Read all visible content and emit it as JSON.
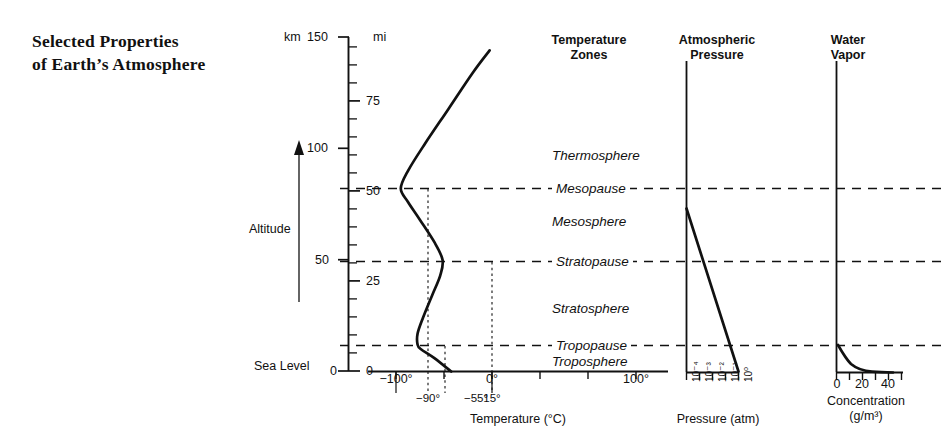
{
  "title_line1": "Selected Properties",
  "title_line2": "of Earth’s Atmosphere",
  "axis": {
    "altitude_label": "Altitude",
    "sea_level_label": "Sea Level",
    "km_unit": "km",
    "mi_unit": "mi",
    "km_ticks": [
      "150",
      "100",
      "50",
      "0"
    ],
    "mi_ticks": [
      "75",
      "50",
      "25",
      "0"
    ]
  },
  "panels": {
    "temperature": {
      "header_line1": "Temperature",
      "header_line2": "Zones",
      "caption": "Temperature (°C)",
      "ticks": [
        "−100°",
        "0°",
        "100°"
      ],
      "ref_labels": [
        "−90°",
        "−55°",
        "15°"
      ],
      "zones": [
        "Thermosphere",
        "Mesopause",
        "Mesosphere",
        "Stratopause",
        "Stratosphere",
        "Tropopause",
        "Troposphere"
      ]
    },
    "pressure": {
      "header_line1": "Atmospheric",
      "header_line2": "Pressure",
      "caption": "Pressure (atm)",
      "ticks": [
        "10⁻⁴",
        "10⁻³",
        "10⁻²",
        "10⁻¹",
        "10⁰"
      ]
    },
    "water_vapor": {
      "header_line1": "Water",
      "header_line2": "Vapor",
      "caption_line1": "Concentration",
      "caption_line2": "(g/m³)",
      "ticks": [
        "0",
        "20",
        "40"
      ]
    }
  },
  "chart_data": {
    "type": "line",
    "ylabel": "Altitude",
    "ylim_km": [
      0,
      150
    ],
    "ylim_mi": [
      0,
      93
    ],
    "grid": false,
    "legend": "none",
    "boundaries": [
      {
        "name": "Tropopause",
        "altitude_km": 12
      },
      {
        "name": "Stratopause",
        "altitude_km": 50
      },
      {
        "name": "Mesopause",
        "altitude_km": 82
      }
    ],
    "layers": [
      {
        "name": "Troposphere",
        "range_km": [
          0,
          12
        ]
      },
      {
        "name": "Stratosphere",
        "range_km": [
          12,
          50
        ]
      },
      {
        "name": "Mesosphere",
        "range_km": [
          50,
          82
        ]
      },
      {
        "name": "Thermosphere",
        "range_km": [
          82,
          150
        ]
      }
    ],
    "series": [
      {
        "name": "Temperature",
        "xlabel": "Temperature (°C)",
        "xlim": [
          -120,
          120
        ],
        "xticks": [
          -100,
          0,
          100
        ],
        "reference_temps": [
          -90,
          -55,
          15
        ],
        "points_temp_c_altitude_km": [
          [
            15,
            0
          ],
          [
            -20,
            6
          ],
          [
            -48,
            10
          ],
          [
            -55,
            12
          ],
          [
            -55,
            17
          ],
          [
            -44,
            24
          ],
          [
            -25,
            34
          ],
          [
            -8,
            43
          ],
          [
            -3,
            50
          ],
          [
            -20,
            58
          ],
          [
            -50,
            68
          ],
          [
            -75,
            76
          ],
          [
            -90,
            82
          ],
          [
            -75,
            90
          ],
          [
            -40,
            102
          ],
          [
            10,
            118
          ],
          [
            60,
            134
          ],
          [
            95,
            144
          ]
        ]
      },
      {
        "name": "Atmospheric Pressure",
        "xlabel": "Pressure (atm)",
        "xscale": "log",
        "xticks": [
          0.0001,
          0.001,
          0.01,
          0.1,
          1
        ],
        "points_pressure_atm_altitude_km": [
          [
            0.0001,
            82
          ],
          [
            0.001,
            62
          ],
          [
            0.01,
            42
          ],
          [
            0.1,
            21
          ],
          [
            1,
            0
          ]
        ]
      },
      {
        "name": "Water Vapor",
        "xlabel": "Concentration (g/m³)",
        "xlim": [
          0,
          48
        ],
        "xticks": [
          0,
          20,
          40
        ],
        "points_conc_gm3_altitude_km": [
          [
            40,
            0
          ],
          [
            18,
            1.5
          ],
          [
            8,
            3
          ],
          [
            4,
            4.5
          ],
          [
            2,
            6
          ],
          [
            1,
            8
          ],
          [
            0.4,
            10
          ],
          [
            0.1,
            12
          ]
        ]
      }
    ]
  }
}
